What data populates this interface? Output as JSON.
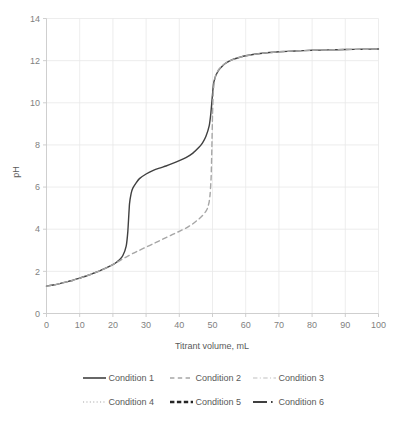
{
  "chart_data": {
    "type": "line",
    "title": "",
    "xlabel": "Titrant volume, mL",
    "ylabel": "pH",
    "xlim": [
      0,
      100
    ],
    "ylim": [
      0,
      14
    ],
    "xticks": [
      0,
      10,
      20,
      30,
      40,
      50,
      60,
      70,
      80,
      90,
      100
    ],
    "yticks": [
      0,
      2,
      4,
      6,
      8,
      10,
      12,
      14
    ],
    "xtick_labels": [
      "0",
      "10",
      "20",
      "30",
      "40",
      "50",
      "60",
      "70",
      "80",
      "90",
      "100"
    ],
    "ytick_labels": [
      "0",
      "2",
      "4",
      "6",
      "8",
      "10",
      "12",
      "14"
    ],
    "grid": true,
    "legend_position": "bottom",
    "series": [
      {
        "name": "Condition 1",
        "style": "solid",
        "color": "#404040",
        "width": 1.4,
        "x": [
          0,
          2,
          4,
          6,
          8,
          10,
          12,
          14,
          16,
          18,
          20,
          21,
          22,
          23,
          24,
          24.5,
          25,
          25.5,
          26,
          27,
          28,
          30,
          32,
          34,
          36,
          38,
          40,
          42,
          44,
          46,
          47,
          48,
          49,
          49.5,
          50,
          50.3,
          50.6,
          51,
          51.5,
          52,
          53,
          54,
          56,
          58,
          60,
          65,
          70,
          75,
          80,
          85,
          90,
          95,
          100
        ],
        "y": [
          1.3,
          1.35,
          1.42,
          1.5,
          1.58,
          1.68,
          1.78,
          1.9,
          2.02,
          2.16,
          2.32,
          2.42,
          2.55,
          2.75,
          3.2,
          3.9,
          5.2,
          5.7,
          5.95,
          6.2,
          6.4,
          6.62,
          6.78,
          6.9,
          7.0,
          7.12,
          7.25,
          7.4,
          7.6,
          7.9,
          8.1,
          8.4,
          8.9,
          9.5,
          10.4,
          10.9,
          11.1,
          11.3,
          11.45,
          11.58,
          11.75,
          11.88,
          12.05,
          12.15,
          12.23,
          12.35,
          12.42,
          12.46,
          12.49,
          12.51,
          12.53,
          12.54,
          12.55
        ]
      },
      {
        "name": "Condition 2",
        "style": "dashed",
        "color": "#a6a6a6",
        "width": 1.4,
        "x": [
          0,
          2,
          4,
          6,
          8,
          10,
          12,
          14,
          16,
          18,
          20,
          22,
          24,
          26,
          28,
          30,
          32,
          34,
          36,
          38,
          40,
          42,
          44,
          46,
          47,
          48,
          48.5,
          49,
          49.3,
          49.6,
          49.8,
          50,
          50.2,
          50.5,
          50.8,
          51,
          51.5,
          52,
          53,
          54,
          56,
          58,
          60,
          65,
          70,
          75,
          80,
          85,
          90,
          95,
          100
        ],
        "y": [
          1.3,
          1.35,
          1.42,
          1.5,
          1.58,
          1.68,
          1.78,
          1.9,
          2.02,
          2.16,
          2.32,
          2.5,
          2.68,
          2.85,
          3.0,
          3.15,
          3.3,
          3.45,
          3.6,
          3.75,
          3.9,
          4.05,
          4.25,
          4.5,
          4.65,
          4.85,
          5.0,
          5.3,
          5.7,
          6.5,
          7.8,
          9.4,
          10.4,
          10.95,
          11.2,
          11.32,
          11.48,
          11.6,
          11.76,
          11.89,
          12.05,
          12.15,
          12.23,
          12.35,
          12.42,
          12.46,
          12.49,
          12.51,
          12.53,
          12.54,
          12.55
        ]
      }
    ]
  },
  "legend": {
    "rows": [
      [
        {
          "label": "Condition 1",
          "style": "solid",
          "color": "#404040",
          "width": 1.6
        },
        {
          "label": "Condition 2",
          "style": "dashed",
          "color": "#a6a6a6",
          "width": 1.3
        },
        {
          "label": "Condition 3",
          "style": "dashdot",
          "color": "#bfbfbf",
          "width": 1.1
        }
      ],
      [
        {
          "label": "Condition 4",
          "style": "dotted",
          "color": "#a6a6a6",
          "width": 1.2
        },
        {
          "label": "Condition 5",
          "style": "thickdash",
          "color": "#262626",
          "width": 2.6
        },
        {
          "label": "Condition 6",
          "style": "thicksolid-dot",
          "color": "#404040",
          "width": 2.2
        }
      ]
    ]
  }
}
